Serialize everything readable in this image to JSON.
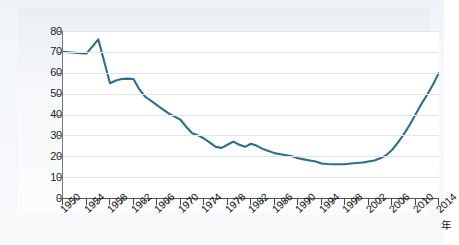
{
  "chart_data": {
    "type": "line",
    "title": "",
    "subtitle": "",
    "xlabel": "年",
    "ylabel": "",
    "xlim": [
      1950,
      2014
    ],
    "ylim": [
      0,
      80
    ],
    "grid": true,
    "legend": null,
    "yticks": [
      0,
      10,
      20,
      30,
      40,
      50,
      60,
      70,
      80
    ],
    "xticks": [
      1950,
      1954,
      1958,
      1962,
      1966,
      1970,
      1974,
      1978,
      1982,
      1986,
      1990,
      1994,
      1998,
      2002,
      2006,
      2010,
      2014
    ],
    "xtick_labels": [
      "1950",
      "1954",
      "1958",
      "1962",
      "1966",
      "1970",
      "1974",
      "1978",
      "1982",
      "1986",
      "1990",
      "1994",
      "1998",
      "2002",
      "2006",
      "2010",
      "2014"
    ],
    "ytick_labels": [
      "0",
      "10",
      "20",
      "30",
      "40",
      "50",
      "60",
      "70",
      "80"
    ],
    "x": [
      1950,
      1951,
      1952,
      1953,
      1954,
      1955,
      1956,
      1957,
      1958,
      1959,
      1960,
      1961,
      1962,
      1963,
      1964,
      1965,
      1966,
      1967,
      1968,
      1969,
      1970,
      1971,
      1972,
      1973,
      1974,
      1975,
      1976,
      1977,
      1978,
      1979,
      1980,
      1981,
      1982,
      1983,
      1984,
      1985,
      1986,
      1987,
      1988,
      1989,
      1990,
      1991,
      1992,
      1993,
      1994,
      1995,
      1996,
      1997,
      1998,
      1999,
      2000,
      2001,
      2002,
      2003,
      2004,
      2005,
      2006,
      2007,
      2008,
      2009,
      2010,
      2011,
      2012,
      2013,
      2014
    ],
    "series": [
      {
        "name": "値",
        "color": "#2d6d8e",
        "values": [
          70.0,
          69.8,
          69.6,
          69.4,
          69.2,
          72.5,
          76.0,
          65.5,
          55.0,
          56.3,
          57.0,
          57.2,
          57.0,
          52.0,
          48.5,
          46.5,
          44.5,
          42.5,
          40.5,
          39.0,
          37.5,
          34.0,
          31.0,
          30.0,
          28.5,
          26.5,
          24.5,
          24.0,
          25.5,
          27.0,
          25.5,
          24.5,
          26.0,
          25.0,
          23.5,
          22.5,
          21.5,
          21.0,
          20.5,
          20.0,
          19.0,
          18.5,
          18.0,
          17.5,
          16.5,
          16.3,
          16.2,
          16.2,
          16.2,
          16.5,
          16.8,
          17.0,
          17.5,
          18.0,
          19.0,
          20.5,
          23.0,
          26.5,
          30.5,
          35.0,
          40.0,
          45.0,
          49.5,
          54.5,
          60.0
        ]
      }
    ]
  },
  "axis": {
    "x_unit_label": "年"
  }
}
